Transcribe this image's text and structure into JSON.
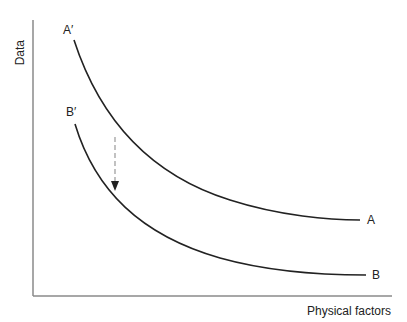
{
  "diagram": {
    "y_axis_label": "Data",
    "x_axis_label": "Physical factors",
    "curves": [
      {
        "name": "A",
        "start_label": "A′",
        "end_label": "A"
      },
      {
        "name": "B",
        "start_label": "B′",
        "end_label": "B"
      }
    ],
    "arrow": {
      "description": "dashed arrow from curve A down to curve B",
      "style": "dashed"
    },
    "colors": {
      "axis": "#888888",
      "curve": "#222222",
      "arrow": "#999999"
    }
  }
}
